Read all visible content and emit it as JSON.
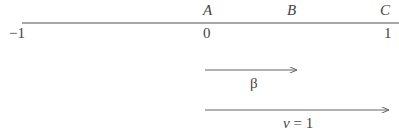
{
  "diagram": {
    "axis": {
      "points": [
        {
          "name": "A",
          "value": "0"
        },
        {
          "name": "B",
          "value": ""
        },
        {
          "name": "C",
          "value": "1"
        }
      ],
      "left_tick": "−1"
    },
    "arrows": [
      {
        "label": "β"
      },
      {
        "label": "v = 1",
        "var": "v",
        "eq": "=",
        "num": "1"
      }
    ],
    "colors": {
      "line": "#888888",
      "text": "#444444"
    }
  }
}
